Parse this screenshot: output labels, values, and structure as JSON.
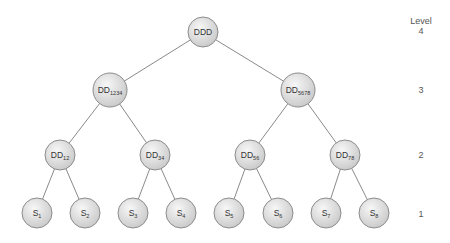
{
  "diagram": {
    "title": "",
    "level_header": "Level",
    "levels": [
      {
        "value": "4",
        "y": 34
      },
      {
        "value": "3",
        "y": 93
      },
      {
        "value": "2",
        "y": 158
      },
      {
        "value": "1",
        "y": 217
      }
    ],
    "colors": {
      "node_fill_light": "#f7f7f7",
      "node_fill_dark": "#c8c8c8",
      "node_stroke": "#8c8c8c",
      "edge": "#8a8a8a",
      "text": "#333333"
    },
    "nodes": [
      {
        "id": "DDD",
        "base": "DDD",
        "sub": "",
        "level": 4,
        "cx": 203,
        "cy": 32,
        "r": 15
      },
      {
        "id": "DD1234",
        "base": "DD",
        "sub": "1234",
        "level": 3,
        "cx": 110,
        "cy": 90,
        "r": 17
      },
      {
        "id": "DD5678",
        "base": "DD",
        "sub": "5678",
        "level": 3,
        "cx": 298,
        "cy": 90,
        "r": 17
      },
      {
        "id": "DD12",
        "base": "DD",
        "sub": "12",
        "level": 2,
        "cx": 60,
        "cy": 155,
        "r": 15
      },
      {
        "id": "DD34",
        "base": "DD",
        "sub": "34",
        "level": 2,
        "cx": 155,
        "cy": 155,
        "r": 15
      },
      {
        "id": "DD56",
        "base": "DD",
        "sub": "56",
        "level": 2,
        "cx": 250,
        "cy": 155,
        "r": 15
      },
      {
        "id": "DD78",
        "base": "DD",
        "sub": "78",
        "level": 2,
        "cx": 345,
        "cy": 155,
        "r": 15
      },
      {
        "id": "S1",
        "base": "S",
        "sub": "1",
        "level": 1,
        "cx": 37,
        "cy": 213,
        "r": 15
      },
      {
        "id": "S2",
        "base": "S",
        "sub": "2",
        "level": 1,
        "cx": 85,
        "cy": 213,
        "r": 15
      },
      {
        "id": "S3",
        "base": "S",
        "sub": "3",
        "level": 1,
        "cx": 133,
        "cy": 213,
        "r": 15
      },
      {
        "id": "S4",
        "base": "S",
        "sub": "4",
        "level": 1,
        "cx": 181,
        "cy": 213,
        "r": 15
      },
      {
        "id": "S5",
        "base": "S",
        "sub": "5",
        "level": 1,
        "cx": 229,
        "cy": 213,
        "r": 15
      },
      {
        "id": "S6",
        "base": "S",
        "sub": "6",
        "level": 1,
        "cx": 278,
        "cy": 213,
        "r": 15
      },
      {
        "id": "S7",
        "base": "S",
        "sub": "7",
        "level": 1,
        "cx": 326,
        "cy": 213,
        "r": 15
      },
      {
        "id": "S8",
        "base": "S",
        "sub": "8",
        "level": 1,
        "cx": 374,
        "cy": 213,
        "r": 15
      }
    ],
    "edges": [
      [
        "DDD",
        "DD1234"
      ],
      [
        "DDD",
        "DD5678"
      ],
      [
        "DD1234",
        "DD12"
      ],
      [
        "DD1234",
        "DD34"
      ],
      [
        "DD5678",
        "DD56"
      ],
      [
        "DD5678",
        "DD78"
      ],
      [
        "DD12",
        "S1"
      ],
      [
        "DD12",
        "S2"
      ],
      [
        "DD34",
        "S3"
      ],
      [
        "DD34",
        "S4"
      ],
      [
        "DD56",
        "S5"
      ],
      [
        "DD56",
        "S6"
      ],
      [
        "DD78",
        "S7"
      ],
      [
        "DD78",
        "S8"
      ]
    ]
  }
}
